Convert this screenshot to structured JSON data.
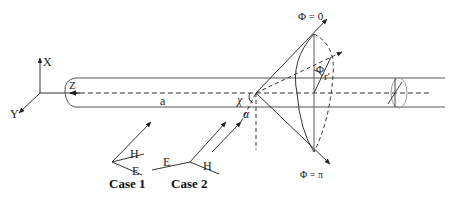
{
  "figure": {
    "type": "scattering-geometry-diagram",
    "colors": {
      "line": "#333333",
      "light": "#888888",
      "background": "#ffffff"
    }
  },
  "axes": {
    "x_label": "X",
    "y_label": "Y",
    "z_label": "Z"
  },
  "cylinder": {
    "radius_label": "a",
    "axis_label": "Z"
  },
  "incidence": {
    "chi_label": "χ",
    "alpha_label": "α"
  },
  "cone": {
    "phi_zero_label": "Φ = 0",
    "phi_pi_label": "Φ = π",
    "phi_label": "Φ",
    "r_label": "r'"
  },
  "cases": [
    {
      "label": "Case 1",
      "h_label": "H",
      "e_label": "E"
    },
    {
      "label": "Case 2",
      "e_label": "E",
      "h_label": "H"
    }
  ]
}
